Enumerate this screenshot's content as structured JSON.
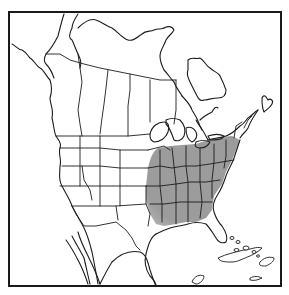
{
  "map": {
    "type": "range-map",
    "region": "North America",
    "colors": {
      "background": "#ffffff",
      "outline": "#1c1c1c",
      "range_fill": "#9c9c9c",
      "range_fill_light": "#b8b8b8"
    },
    "frame": {
      "x": 9,
      "y": 12,
      "width": 272,
      "height": 274
    },
    "shaded_range": {
      "description": "Eastern United States shaded (approx. from Great Lakes south to Gulf coast, Atlantic coast west to eastern Plains)",
      "path": "M148,168 C150,160 152,152 158,148 L170,146 L182,145 L196,144 L208,140 L220,137 L232,136 L240,140 L236,150 L232,160 L226,172 L222,184 L214,196 L212,210 L206,218 L196,222 L186,222 L176,224 L164,226 L156,224 L150,214 L146,200 L146,186 Z"
    },
    "coastlines": [
      "M12,44 C16,46 18,50 22,50 C26,52 28,56 30,58 C34,60 36,66 40,68 C44,70 46,76 50,80 C52,86 52,92 50,98 C50,104 54,110 52,118 C54,126 54,132 56,136 C58,140 62,142 60,148 C58,154 62,160 60,166 C60,172 58,180 62,186 C66,194 70,200 72,206 C76,214 80,220 84,228 C88,236 90,244 92,252 C94,262 96,272 98,284",
      "M66,240 C72,248 76,256 80,264 C84,272 86,278 88,284",
      "M72,236 C76,244 80,250 84,258 C86,266 88,276 90,284",
      "M78,232 C80,240 84,248 88,256 C92,264 96,272 100,284",
      "M100,284 C104,276 108,268 112,262 C120,254 130,250 140,252 C146,254 148,262 150,270 C152,276 154,282 156,286",
      "M64,14 C62,20 60,28 58,36 C54,44 50,50 46,54 C44,58 44,62 46,64 C50,68 52,72 54,78",
      "M78,14 C74,20 72,24 72,28 C70,32 68,38 72,40 C74,44 76,50 78,54 C80,58 82,62 80,68",
      "M78,28 C84,22 90,18 96,20 C102,22 106,26 112,28 C118,32 122,38 128,40 C134,42 138,36 142,34 C146,30 150,32 154,30 C158,28 160,30 164,28",
      "M164,28 C168,26 172,26 174,30 C172,34 168,36 166,40 C164,46 160,50 160,56 C160,62 162,66 164,70 C168,74 170,78 174,82 C176,88 180,92 182,96",
      "M182,96 C186,100 190,104 192,110 C196,116 198,120 200,126 C204,132 206,136 208,140",
      "M188,60 C192,56 196,60 200,58 C204,60 206,66 210,68 C214,72 218,72 220,76 C222,80 224,84 226,90 C226,96 222,98 218,98 C212,98 208,100 204,100 C200,102 198,98 196,94 C194,90 192,86 190,82 C188,78 186,74 188,70 Z",
      "M200,120 C204,116 208,114 212,112 C214,108 216,106 218,108",
      "M262,98 C264,94 266,96 268,100 C270,98 274,100 272,104 C270,108 266,110 264,112 C262,108 262,104 262,98 Z",
      "M258,110 C254,116 250,122 248,128 C246,132 242,134 240,138",
      "M208,140 C214,138 220,138 226,136 C232,134 236,130 240,126 C244,124 246,120 248,118 C252,116 254,112 258,110",
      "M240,140 C238,146 236,152 234,158 C232,164 228,170 226,176 C224,182 222,188 218,194 C214,200 212,206 214,212 C216,218 218,222 222,226 C226,232 228,238 226,242 C222,244 218,242 216,238 C212,232 210,228 206,224 C200,222 194,222 188,224 C182,226 176,226 170,228 C164,230 160,232 156,234",
      "M156,234 C150,238 148,246 146,254 C144,262 146,270 150,276 C154,280 156,284 156,286",
      "M196,120 C198,124 200,126 202,130",
      "M150,134 C152,126 158,122 164,122 C168,122 170,126 168,132 C166,138 160,142 154,142 C150,140 150,138 150,134 Z",
      "M166,120 C170,118 176,118 180,120 C184,124 186,130 184,136 C182,140 178,142 174,140 C172,134 170,128 166,124 Z",
      "M186,128 C190,126 194,128 196,132 C198,136 196,140 192,142 C188,140 186,134 186,128 Z",
      "M196,142 C200,140 206,140 210,142 C208,146 204,148 200,148 C196,148 194,146 196,142 Z",
      "M208,136 C214,134 220,134 224,136 C222,140 216,140 210,140 Z"
    ],
    "state_borders": [
      "M46,54 L60,54 L70,60 L84,64 L100,68 L120,72 L140,76 L160,80 L176,80",
      "M78,54 L80,68 L82,82 L80,96 L78,110 L80,124 L82,136",
      "M108,70 L106,88 L104,104 L102,118 L100,134",
      "M130,74 L130,90 L128,106 L128,122 L128,136",
      "M56,136 L80,136 L100,136 L128,136 L150,134",
      "M60,148 L80,148 L100,148 L120,150 L148,150",
      "M62,166 L80,166 L100,166 L120,168 L148,168",
      "M60,186 L78,186 L100,186 L120,186 L146,186",
      "M72,206 L96,206 L116,206 L146,204",
      "M80,136 L80,166 L80,186",
      "M100,136 L100,166 L100,186 L100,206",
      "M120,150 L120,168 L120,186 L120,206",
      "M82,166 L84,180 L90,190 L92,200",
      "M72,206 L76,214 L84,226 L96,226 L116,222 L126,230 L132,238 L136,246 L140,250",
      "M116,206 L118,220",
      "M146,186 L146,204 L150,214 L148,226",
      "M148,150 L156,148 L164,146 L170,150",
      "M148,168 L160,166 L172,168 L184,166 L196,166 L210,164 L222,162 L234,160",
      "M146,186 L160,186 L176,184 L190,182 L206,182 L220,180",
      "M150,204 L164,204 L180,202 L196,202 L212,202",
      "M160,150 L160,168 L160,186 L162,204 L162,222",
      "M172,148 L174,166 L176,184 L176,202 L176,224",
      "M186,146 L186,166 L188,182 L188,202 L188,222",
      "M200,148 L200,166 L200,182 L202,202 L200,218",
      "M214,144 L214,162 L212,180 L212,198",
      "M226,140 L226,156 L224,168",
      "M234,138 L236,126 L242,122",
      "M244,128 L248,120 L252,116",
      "M176,80 L176,96 L176,110 L174,124",
      "M150,80 L150,96 L150,110 L150,122"
    ],
    "caribbean_islands": [
      "M218,258 C226,254 236,252 244,250 C250,250 256,246 262,248 C258,252 254,254 250,256 C244,258 238,262 232,262 C226,262 220,262 218,258 Z",
      "M260,262 C264,258 268,256 274,258 C274,262 270,264 266,266 C262,266 258,266 260,262 Z",
      "M232,238 m-2,0 a2,1.5 0 1,0 4,0 a2,1.5 0 1,0 -4,0",
      "M238,242 m-2,0 a2,1.5 0 1,0 4,0 a2,1.5 0 1,0 -4,0",
      "M236,250 m-2,0 a2.5,1.5 0 1,0 5,0 a2.5,1.5 0 1,0 -5,0",
      "M246,248 m-3,0 a3,2 0 1,0 6,0 a3,2 0 1,0 -6,0",
      "M254,252 m-2,0 a2,1.5 0 1,0 4,0 a2,1.5 0 1,0 -4,0",
      "M258,256 m-1.5,0 a1.5,1.2 0 1,0 3,0 a1.5,1.2 0 1,0 -3,0",
      "M250,278 C254,276 258,276 262,278 C258,280 254,281 250,280 Z",
      "M192,282 C194,276 200,274 204,276 C204,280 200,284 196,284 Z"
    ]
  }
}
